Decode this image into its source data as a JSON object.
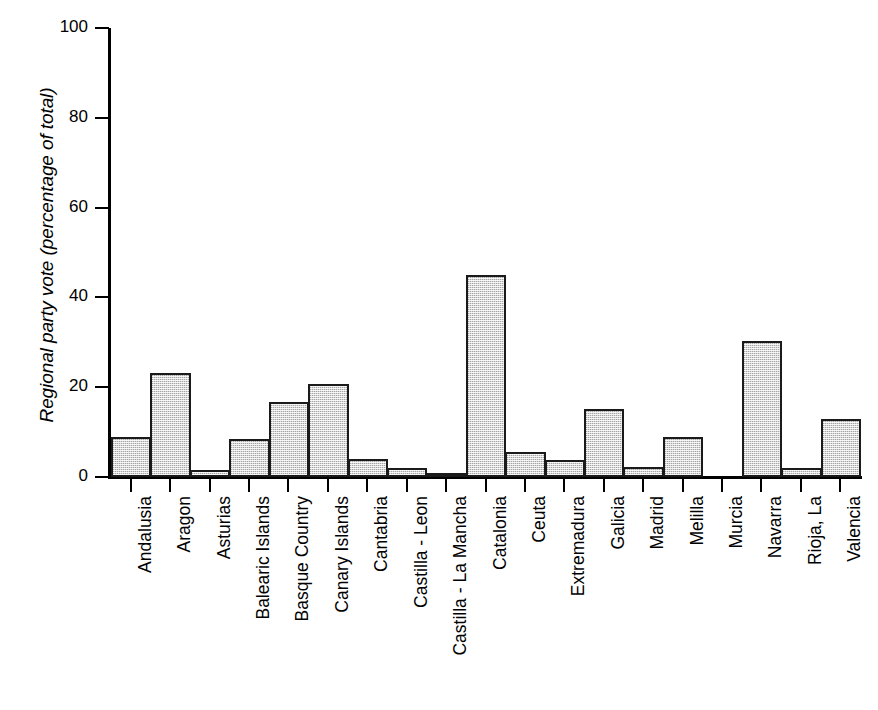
{
  "chart_data": {
    "type": "bar",
    "title": "",
    "xlabel": "",
    "ylabel": "Regional party vote (percentage of total)",
    "ylim": [
      0,
      100
    ],
    "yticks": [
      0,
      20,
      40,
      60,
      80,
      100
    ],
    "grid": false,
    "legend": null,
    "orientation": "vertical",
    "bar_style": {
      "fill": "#d9d9d9",
      "pattern": "stippled-grey",
      "edge": "#1a1a1a"
    },
    "categories": [
      "Andalusia",
      "Aragon",
      "Asturias",
      "Balearic Islands",
      "Basque Country",
      "Canary Islands",
      "Cantabria",
      "Castilla - Leon",
      "Castilla - La Mancha",
      "Catalonia",
      "Ceuta",
      "Extremadura",
      "Galicia",
      "Madrid",
      "Melilla",
      "Murcia",
      "Navarra",
      "Rioja, La",
      "Valencia"
    ],
    "values": [
      9.0,
      23.1,
      1.5,
      8.4,
      16.7,
      20.7,
      4.1,
      2.1,
      0.7,
      45.1,
      5.6,
      3.7,
      15.1,
      2.2,
      9.0,
      0.0,
      30.4,
      2.0,
      13.0
    ]
  },
  "axis": {
    "y_tick_labels": [
      "0",
      "20",
      "40",
      "60",
      "80",
      "100"
    ]
  }
}
